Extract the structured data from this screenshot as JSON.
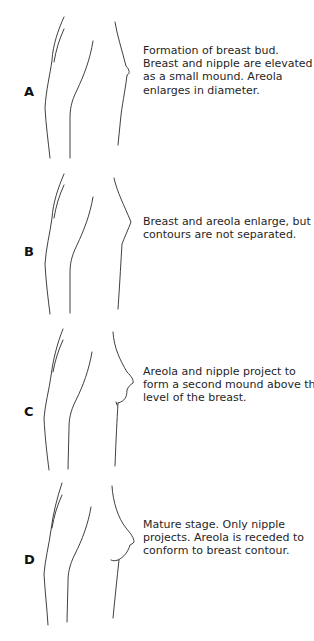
{
  "figure": {
    "stages": [
      {
        "label": "A",
        "description_lines": [
          "Formation of breast bud.",
          "Breast and nipple are elevated",
          "as a small mound.  Areola",
          "enlarges in diameter."
        ]
      },
      {
        "label": "B",
        "description_lines": [
          "Breast and areola enlarge, but",
          "contours are not separated."
        ]
      },
      {
        "label": "C",
        "description_lines": [
          "Areola and nipple project to",
          "form a second mound above the",
          "level of the breast."
        ]
      },
      {
        "label": "D",
        "description_lines": [
          "Mature stage.  Only nipple",
          "projects.  Areola is receded to",
          "conform to breast contour."
        ]
      }
    ],
    "line_color": "#2a2a2a",
    "text_color": "#1f1f1f"
  }
}
